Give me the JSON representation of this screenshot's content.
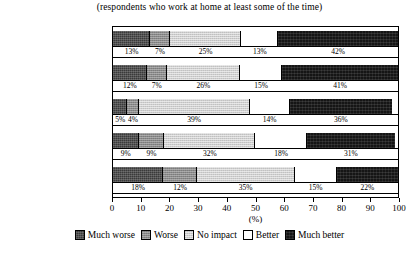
{
  "subtitle": "(respondents who work at home at least some of the time)",
  "axis": {
    "title": "(%)",
    "ticks": [
      "0",
      "10",
      "20",
      "30",
      "40",
      "50",
      "60",
      "70",
      "80",
      "90",
      "100"
    ]
  },
  "legend": {
    "items": [
      {
        "label": "Much worse",
        "key": "much-worse",
        "color": "#3a3a3a"
      },
      {
        "label": "Worse",
        "key": "worse",
        "color": "#8a8a8a"
      },
      {
        "label": "No impact",
        "key": "no-impact",
        "color": "#cfcfcf"
      },
      {
        "label": "Better",
        "key": "better",
        "color": "#ffffff"
      },
      {
        "label": "Much better",
        "key": "much-better",
        "color": "#151515"
      }
    ]
  },
  "chart_data": {
    "type": "bar",
    "orientation": "horizontal",
    "stacked": true,
    "title": "",
    "subtitle": "(respondents who work at home at least some of the time)",
    "xlabel": "(%)",
    "ylabel": "",
    "xlim": [
      0,
      100
    ],
    "xticks": [
      0,
      10,
      20,
      30,
      40,
      50,
      60,
      70,
      80,
      90,
      100
    ],
    "grid": false,
    "legend_position": "bottom",
    "categories": [
      "Family life",
      "Working hours",
      "Finances",
      "Time pressures",
      "Networks/work contacts"
    ],
    "series": [
      {
        "name": "Much worse",
        "values": [
          13,
          12,
          5,
          9,
          18
        ]
      },
      {
        "name": "Worse",
        "values": [
          7,
          7,
          4,
          9,
          12
        ]
      },
      {
        "name": "No impact",
        "values": [
          25,
          26,
          39,
          32,
          35
        ]
      },
      {
        "name": "Better",
        "values": [
          13,
          15,
          14,
          18,
          15
        ]
      },
      {
        "name": "Much better",
        "values": [
          42,
          41,
          36,
          31,
          22
        ]
      }
    ],
    "data_labels": [
      {
        "category": "Family life",
        "labels": [
          "13%",
          "7%",
          "25%",
          "13%",
          "42%"
        ]
      },
      {
        "category": "Working hours",
        "labels": [
          "12%",
          "7%",
          "26%",
          "15%",
          "41%"
        ]
      },
      {
        "category": "Finances",
        "labels": [
          "5%",
          "4%",
          "39%",
          "14%",
          "36%"
        ]
      },
      {
        "category": "Time pressures",
        "labels": [
          "9%",
          "9%",
          "32%",
          "18%",
          "31%"
        ]
      },
      {
        "category": "Networks/work contacts",
        "labels": [
          "18%",
          "12%",
          "35%",
          "15%",
          "22%"
        ]
      }
    ]
  }
}
